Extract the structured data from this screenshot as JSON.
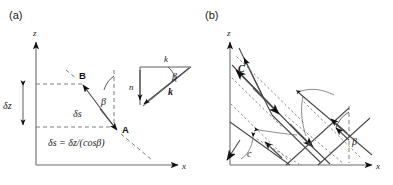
{
  "figure": {
    "background_color": "#ffffff",
    "ink_color": "#1a1a1a",
    "line_color": "#4a4a4a",
    "axis_color": "#6b6b6b"
  },
  "panel_a": {
    "tag": "(a)",
    "axes": {
      "z_label": "z",
      "x_label": "x"
    },
    "annotations": {
      "point_b": "B",
      "point_a": "A",
      "delta_z": "δz",
      "delta_s": "δs",
      "beta": "β",
      "equation": "δs = δz/(cosβ)"
    },
    "inset_triangle": {
      "top_label": "k",
      "left_label": "n",
      "hyp_label": "k",
      "angle_label": "β"
    }
  },
  "panel_b": {
    "tag": "(b)",
    "axes": {
      "z_label": "z",
      "x_label": "x"
    },
    "annotations": {
      "flux_upper": "C",
      "flux_lower": "c",
      "beta": "β"
    }
  }
}
